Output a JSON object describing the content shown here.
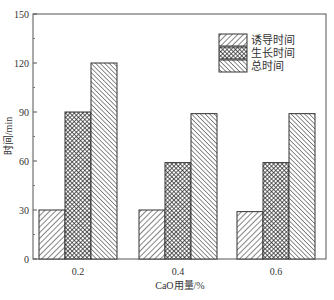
{
  "chart_data": {
    "type": "bar",
    "title": "",
    "xlabel": "CaO用量/%",
    "ylabel": "时间/min",
    "categories": [
      "0.2",
      "0.4",
      "0.6"
    ],
    "series": [
      {
        "name": "诱导时间",
        "values": [
          30,
          30,
          29
        ],
        "pattern": "diagonal-forward"
      },
      {
        "name": "生长时间",
        "values": [
          90,
          59,
          59
        ],
        "pattern": "crosshatch"
      },
      {
        "name": "总时间",
        "values": [
          120,
          89,
          89
        ],
        "pattern": "diagonal-backward"
      }
    ],
    "ylim": [
      0,
      150
    ],
    "yticks": [
      0,
      30,
      60,
      90,
      120,
      150
    ],
    "grid": false,
    "legend_position": "upper right"
  },
  "axes": {
    "y_tick_labels": [
      "0",
      "30",
      "60",
      "90",
      "120",
      "150"
    ],
    "x_tick_labels": [
      "0.2",
      "0.4",
      "0.6"
    ],
    "xlabel": "CaO用量/%",
    "ylabel": "时间/min"
  },
  "legend": {
    "items": [
      {
        "label": "诱导时间"
      },
      {
        "label": "生长时间"
      },
      {
        "label": "总时间"
      }
    ]
  }
}
